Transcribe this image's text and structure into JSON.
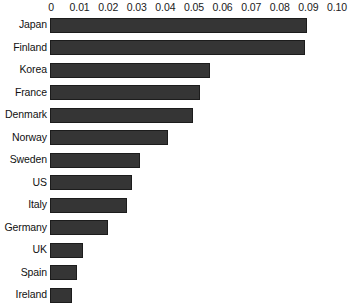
{
  "chart_data": {
    "type": "bar",
    "orientation": "horizontal",
    "title": "",
    "subtitle": "",
    "xlabel": "",
    "ylabel": "",
    "xlim": [
      0,
      0.1
    ],
    "grid": false,
    "legend": null,
    "axis_position": "top",
    "tick_labels": [
      "0",
      "0.01",
      "0.02",
      "0.03",
      "0.04",
      "0.05",
      "0.06",
      "0.07",
      "0.08",
      "0.09",
      "0.10"
    ],
    "tick_values": [
      0,
      0.01,
      0.02,
      0.03,
      0.04,
      0.05,
      0.06,
      0.07,
      0.08,
      0.09,
      0.1
    ],
    "categories": [
      "Japan",
      "Finland",
      "Korea",
      "France",
      "Denmark",
      "Norway",
      "Sweden",
      "US",
      "Italy",
      "Germany",
      "UK",
      "Spain",
      "Ireland"
    ],
    "values": [
      0.0895,
      0.0888,
      0.0555,
      0.052,
      0.0498,
      0.041,
      0.031,
      0.0283,
      0.0265,
      0.0198,
      0.0112,
      0.009,
      0.0072
    ],
    "bar_color": "#353535",
    "bar_edge_color": "#1c1c1c",
    "background_color": "#ffffff"
  }
}
